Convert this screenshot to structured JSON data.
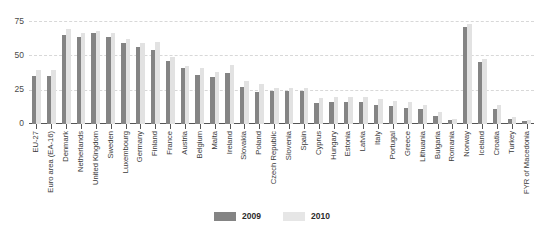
{
  "chart_data": {
    "type": "bar",
    "title": "",
    "xlabel": "",
    "ylabel": "",
    "ylim": [
      0,
      80
    ],
    "yticks": [
      0,
      25,
      50,
      75
    ],
    "grid": true,
    "legend_position": "bottom",
    "categories": [
      "EU-27",
      "Euro area (EA-16)",
      "Denmark",
      "Netherlands",
      "United Kingdom",
      "Sweden",
      "Luxembourg",
      "Germany",
      "Finland",
      "France",
      "Austria",
      "Belgium",
      "Malta",
      "Ireland",
      "Slovakia",
      "Poland",
      "Czech Republic",
      "Slovenia",
      "Spain",
      "Cyprus",
      "Hungary",
      "Estonia",
      "Latvia",
      "Italy",
      "Portugal",
      "Greece",
      "Lithuania",
      "Bulgaria",
      "Romania",
      "Norway",
      "Iceland",
      "Croatia",
      "Turkey",
      "FYR of Macedonia"
    ],
    "series": [
      {
        "name": "2009",
        "color": "#848484",
        "values": [
          35,
          35,
          65,
          63,
          66,
          63,
          59,
          56,
          54,
          46,
          41,
          36,
          34,
          37,
          27,
          23,
          24,
          24,
          24,
          15,
          16,
          16,
          16,
          14,
          13,
          12,
          11,
          6,
          3,
          71,
          45,
          11,
          4,
          2
        ]
      },
      {
        "name": "2010",
        "color": "#e2e2e2",
        "values": [
          39,
          39,
          69,
          66,
          68,
          66,
          62,
          59,
          60,
          49,
          42,
          41,
          38,
          43,
          31,
          29,
          26,
          26,
          26,
          19,
          20,
          20,
          20,
          18,
          17,
          16,
          14,
          9,
          4,
          73,
          47,
          14,
          5,
          3
        ]
      }
    ]
  }
}
